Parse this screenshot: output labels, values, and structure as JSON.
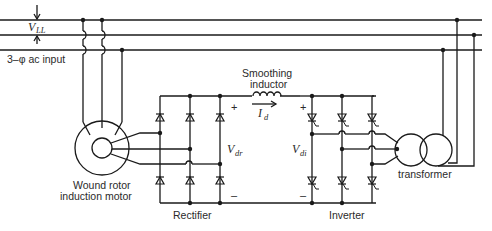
{
  "diagram": {
    "type": "circuit",
    "labels": {
      "vll_main": "V",
      "vll_sub": "LL",
      "ac_input": "3–φ ac input",
      "motor_line1": "Wound rotor",
      "motor_line2": "induction motor",
      "rectifier": "Rectifier",
      "inductor_line1": "Smoothing",
      "inductor_line2": "inductor",
      "id_main": "I",
      "id_sub": "d",
      "vdr_main": "V",
      "vdr_sub": "dr",
      "vdi_main": "V",
      "vdi_sub": "di",
      "inverter": "Inverter",
      "transformer": "transformer",
      "plus": "+",
      "minus": "–"
    },
    "nodes": [
      "3-phase ac bus",
      "wound rotor induction motor",
      "diode rectifier",
      "smoothing inductor",
      "thyristor inverter",
      "transformer"
    ],
    "edges": [
      {
        "from": "3-phase ac bus",
        "to": "wound rotor induction motor",
        "label": "stator supply"
      },
      {
        "from": "wound rotor induction motor",
        "to": "diode rectifier",
        "label": "rotor slip power"
      },
      {
        "from": "diode rectifier",
        "to": "smoothing inductor",
        "label": "Id"
      },
      {
        "from": "smoothing inductor",
        "to": "thyristor inverter",
        "label": "dc link"
      },
      {
        "from": "thyristor inverter",
        "to": "transformer",
        "label": "ac"
      },
      {
        "from": "transformer",
        "to": "3-phase ac bus",
        "label": "power returned"
      }
    ]
  }
}
